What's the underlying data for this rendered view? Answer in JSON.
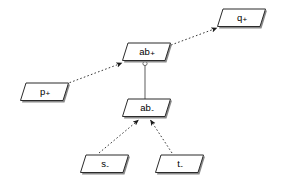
{
  "diagram": {
    "background_color": "#ffffff",
    "node_fill_color": "#ffffff",
    "node_border_color": "#000000",
    "node_shadow_color": "#808080",
    "edge_color": "#000000",
    "nodes": [
      {
        "id": "q_plus",
        "base": "q",
        "sign": "+",
        "x": 217,
        "y": 8,
        "shape": "parallelogram"
      },
      {
        "id": "ab_plus",
        "base": "ab",
        "sign": "+",
        "x": 122,
        "y": 42,
        "shape": "parallelogram"
      },
      {
        "id": "p_plus",
        "base": "p",
        "sign": "+",
        "x": 20,
        "y": 82,
        "shape": "parallelogram"
      },
      {
        "id": "ab_minus",
        "base": "ab",
        "sign": "-",
        "x": 122,
        "y": 98,
        "shape": "parallelogram"
      },
      {
        "id": "s_minus",
        "base": "s",
        "sign": "-",
        "x": 80,
        "y": 154,
        "shape": "parallelogram"
      },
      {
        "id": "t_minus",
        "base": "t",
        "sign": "-",
        "x": 155,
        "y": 154,
        "shape": "parallelogram"
      }
    ],
    "edges": [
      {
        "id": "edge-p-to-ab-plus",
        "from": "p_plus",
        "to": "ab_plus",
        "style": "dashed",
        "arrowhead": "filled-triangle",
        "x1": 66,
        "y1": 84,
        "x2": 124,
        "y2": 62
      },
      {
        "id": "edge-ab-plus-to-q",
        "from": "ab_plus",
        "to": "q_plus",
        "style": "dashed",
        "arrowhead": "filled-triangle",
        "x1": 170,
        "y1": 45,
        "x2": 219,
        "y2": 28
      },
      {
        "id": "edge-ab-plus-to-ab-minus",
        "from": "ab_plus",
        "to": "ab_minus",
        "style": "solid",
        "arrowhead": "hollow-circle",
        "x1": 145,
        "y1": 62,
        "x2": 145,
        "y2": 98
      },
      {
        "id": "edge-s-to-ab-minus",
        "from": "s_minus",
        "to": "ab_minus",
        "style": "dashed",
        "arrowhead": "filled-triangle",
        "x1": 99,
        "y1": 153,
        "x2": 139,
        "y2": 121
      },
      {
        "id": "edge-t-to-ab-minus",
        "from": "t_minus",
        "to": "ab_minus",
        "style": "dashed",
        "arrowhead": "filled-triangle",
        "x1": 170,
        "y1": 153,
        "x2": 150,
        "y2": 121
      }
    ]
  }
}
